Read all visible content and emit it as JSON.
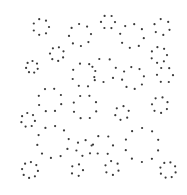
{
  "image": {
    "width": 187,
    "height": 195,
    "background": "#ffffff",
    "dot_color": "#3a3a3a",
    "dot_radius": 1.1
  },
  "clusters": [
    {
      "cx": 41,
      "cy": 27,
      "r": 8,
      "n": 7
    },
    {
      "cx": 80,
      "cy": 35,
      "r": 11,
      "n": 8
    },
    {
      "cx": 57,
      "cy": 54,
      "r": 7,
      "n": 7
    },
    {
      "cx": 32,
      "cy": 67,
      "r": 6,
      "n": 7
    },
    {
      "cx": 84,
      "cy": 75,
      "r": 12,
      "n": 8
    },
    {
      "cx": 50,
      "cy": 100,
      "r": 12,
      "n": 8
    },
    {
      "cx": 108,
      "cy": 22,
      "r": 7,
      "n": 6
    },
    {
      "cx": 132,
      "cy": 36,
      "r": 12,
      "n": 8
    },
    {
      "cx": 162,
      "cy": 27,
      "r": 8,
      "n": 6
    },
    {
      "cx": 159,
      "cy": 55,
      "r": 8,
      "n": 7
    },
    {
      "cx": 104,
      "cy": 70,
      "r": 12,
      "n": 7
    },
    {
      "cx": 133,
      "cy": 78,
      "r": 11,
      "n": 8
    },
    {
      "cx": 165,
      "cy": 75,
      "r": 8,
      "n": 6
    },
    {
      "cx": 28,
      "cy": 120,
      "r": 7,
      "n": 7
    },
    {
      "cx": 85,
      "cy": 107,
      "r": 12,
      "n": 8
    },
    {
      "cx": 53,
      "cy": 142,
      "r": 16,
      "n": 10
    },
    {
      "cx": 84,
      "cy": 148,
      "r": 8,
      "n": 6
    },
    {
      "cx": 30,
      "cy": 170,
      "r": 8,
      "n": 8
    },
    {
      "cx": 77,
      "cy": 170,
      "r": 6,
      "n": 5
    },
    {
      "cx": 122,
      "cy": 113,
      "r": 7,
      "n": 6
    },
    {
      "cx": 160,
      "cy": 105,
      "r": 8,
      "n": 7
    },
    {
      "cx": 103,
      "cy": 145,
      "r": 10,
      "n": 6
    },
    {
      "cx": 142,
      "cy": 145,
      "r": 17,
      "n": 10
    },
    {
      "cx": 112,
      "cy": 168,
      "r": 7,
      "n": 6
    },
    {
      "cx": 168,
      "cy": 170,
      "r": 8,
      "n": 8
    }
  ]
}
